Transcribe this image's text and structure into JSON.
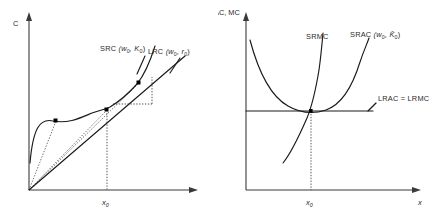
{
  "figure": {
    "panels": [
      {
        "id": "total-cost",
        "y_axis_label": "C",
        "x_axis_label": "",
        "x_tick_label": "x",
        "x_tick_sub": "0",
        "curves": [
          {
            "name": "SRC",
            "label_main": "SRC",
            "label_args": "(w",
            "label_arg1_sub": "0",
            "label_sep": ", K",
            "label_arg2_sub": "0",
            "label_close": ")",
            "full_label": "SRC (w0, K0)",
            "shape": "s-curve",
            "color": "#1a1a1a"
          },
          {
            "name": "LRC",
            "label_main": "LRC",
            "label_args": "(w",
            "label_arg1_sub": "0",
            "label_sep": ", r",
            "label_arg2_sub": "0",
            "label_close": ")",
            "full_label": "LRC (w0, r0)",
            "shape": "ray-from-origin",
            "color": "#1a1a1a"
          }
        ],
        "markers": [
          {
            "name": "tangency-low",
            "x": 56,
            "y": 121
          },
          {
            "name": "tangency-mid",
            "x": 107,
            "y": 110
          },
          {
            "name": "tangency-high",
            "x": 139,
            "y": 83
          }
        ]
      },
      {
        "id": "average-marginal-cost",
        "y_axis_label": "AC, MC",
        "x_axis_label": "x",
        "x_tick_label": "x",
        "x_tick_sub": "0",
        "curves": [
          {
            "name": "SRMC",
            "label_main": "SRMC",
            "full_label": "SRMC",
            "shape": "increasing",
            "color": "#1a1a1a"
          },
          {
            "name": "SRAC",
            "label_main": "SRAC",
            "label_args": "(w",
            "label_arg1_sub": "0",
            "label_sep": ", K̄",
            "label_arg2_sub": "0",
            "label_close": ")",
            "full_label": "SRAC (w0, K̄0)",
            "shape": "u-shaped",
            "color": "#1a1a1a"
          },
          {
            "name": "LRAC-LRMC",
            "label_main": "LRAC = LRMC",
            "full_label": "LRAC = LRMC",
            "shape": "horizontal-line",
            "color": "#1a1a1a"
          }
        ],
        "markers": [
          {
            "name": "minimum-point",
            "x": 93,
            "y": 111
          }
        ]
      }
    ],
    "colors": {
      "curve": "#1a1a1a",
      "axis": "#3a3a3a",
      "dotted": "#555555",
      "text": "#2b2b2b",
      "background": "#ffffff"
    }
  }
}
